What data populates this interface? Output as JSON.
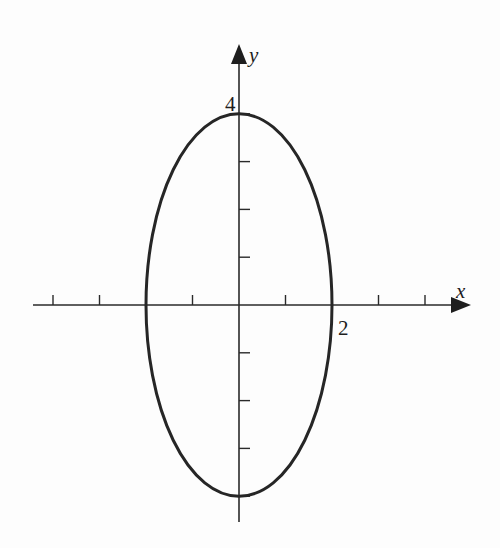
{
  "chart_data": {
    "type": "line",
    "title": "",
    "xlabel": "x",
    "ylabel": "y",
    "xlim": [
      -4.5,
      5
    ],
    "ylim": [
      -4.6,
      5.5
    ],
    "grid": false,
    "x_ticks": [
      -4,
      -3,
      -2,
      -1,
      1,
      2,
      3,
      4
    ],
    "y_ticks": [
      -4,
      -3,
      -2,
      -1,
      1,
      2,
      3,
      4
    ],
    "tick_labels": [
      {
        "axis": "y",
        "value": 4,
        "text": "4"
      },
      {
        "axis": "x",
        "value": 2,
        "text": "2"
      }
    ],
    "series": [
      {
        "name": "ellipse",
        "equation": "x^2/4 + y^2/16 = 1",
        "center": [
          0,
          0
        ],
        "semi_axis_x": 2,
        "semi_axis_y": 4,
        "color": "#262626"
      }
    ]
  }
}
